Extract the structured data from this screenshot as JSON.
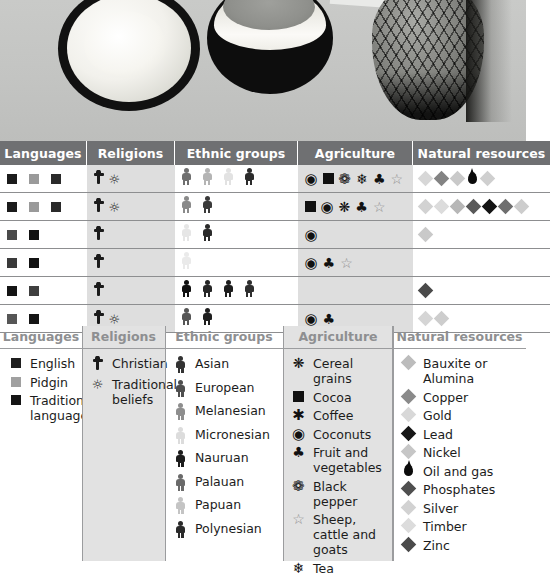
{
  "photo": {
    "alt": "black and white photo of a split coconut and a pineapple on a surface",
    "items": [
      "coconut-half-open",
      "coconut-half-bowl",
      "pineapple",
      "knife-blade"
    ]
  },
  "table": {
    "headers": [
      "Languages",
      "Religions",
      "Ethnic groups",
      "Agriculture",
      "Natural resources"
    ],
    "header_bg": "#6f7072",
    "shaded_column_bg": "#dedede",
    "rows": [
      {
        "languages": [
          {
            "type": "square",
            "color": "#1b1b1b"
          },
          {
            "type": "square",
            "color": "#9a9a9a"
          },
          {
            "type": "square",
            "color": "#2a2a2a"
          }
        ],
        "religions": [
          {
            "type": "cross",
            "color": "#1b1b1b"
          },
          {
            "type": "sun",
            "color": "#1b1b1b"
          }
        ],
        "ethnic": [
          {
            "type": "person",
            "color": "#6f6f6f"
          },
          {
            "type": "person",
            "color": "#b4b4b4"
          },
          {
            "type": "person",
            "color": "#e2e2e2"
          },
          {
            "type": "person",
            "color": "#2b2b2b"
          }
        ],
        "agriculture": [
          {
            "type": "coconut"
          },
          {
            "type": "cocoa"
          },
          {
            "type": "blackpepper"
          },
          {
            "type": "tea"
          },
          {
            "type": "fruitveg"
          },
          {
            "type": "sheep"
          }
        ],
        "resources": [
          {
            "type": "diamond",
            "color": "#d7d7d7"
          },
          {
            "type": "diamond",
            "color": "#838383"
          },
          {
            "type": "diamond",
            "color": "#c9c9c9"
          },
          {
            "type": "oil"
          },
          {
            "type": "diamond",
            "color": "#cfcfcf"
          }
        ]
      },
      {
        "languages": [
          {
            "type": "square",
            "color": "#1b1b1b"
          },
          {
            "type": "square",
            "color": "#9a9a9a"
          },
          {
            "type": "square",
            "color": "#2a2a2a"
          }
        ],
        "religions": [
          {
            "type": "cross",
            "color": "#1b1b1b"
          },
          {
            "type": "sun",
            "color": "#1b1b1b"
          }
        ],
        "ethnic": [
          {
            "type": "person",
            "color": "#8a8a8a"
          },
          {
            "type": "person",
            "color": "#3a3a3a"
          }
        ],
        "agriculture": [
          {
            "type": "cocoa"
          },
          {
            "type": "coconut"
          },
          {
            "type": "cereal"
          },
          {
            "type": "fruitveg"
          },
          {
            "type": "sheep"
          }
        ],
        "resources": [
          {
            "type": "diamond",
            "color": "#d2d2d2"
          },
          {
            "type": "diamond",
            "color": "#dcdcdc"
          },
          {
            "type": "diamond",
            "color": "#b7b7b7"
          },
          {
            "type": "diamond",
            "color": "#595959"
          },
          {
            "type": "diamond",
            "color": "#141414"
          },
          {
            "type": "diamond",
            "color": "#6e6e6e"
          },
          {
            "type": "diamond",
            "color": "#cdcdcd"
          }
        ]
      },
      {
        "languages": [
          {
            "type": "square",
            "color": "#4a4a4a"
          },
          {
            "type": "square",
            "color": "#121212"
          }
        ],
        "religions": [
          {
            "type": "cross",
            "color": "#1b1b1b"
          }
        ],
        "ethnic": [
          {
            "type": "person",
            "color": "#e6e6e6"
          },
          {
            "type": "person",
            "color": "#2b2b2b"
          }
        ],
        "agriculture": [
          {
            "type": "coconut"
          }
        ],
        "resources": [
          {
            "type": "diamond",
            "color": "#c9c9c9"
          }
        ]
      },
      {
        "languages": [
          {
            "type": "square",
            "color": "#3a3a3a"
          },
          {
            "type": "square",
            "color": "#121212"
          }
        ],
        "religions": [
          {
            "type": "cross",
            "color": "#1b1b1b"
          }
        ],
        "ethnic": [
          {
            "type": "person",
            "color": "#eaeaea"
          }
        ],
        "agriculture": [
          {
            "type": "coconut"
          },
          {
            "type": "fruitveg"
          },
          {
            "type": "sheep"
          }
        ],
        "resources": []
      },
      {
        "languages": [
          {
            "type": "square",
            "color": "#141414"
          },
          {
            "type": "square",
            "color": "#3f3f3f"
          }
        ],
        "religions": [
          {
            "type": "cross",
            "color": "#1b1b1b"
          }
        ],
        "ethnic": [
          {
            "type": "person",
            "color": "#111111"
          },
          {
            "type": "person",
            "color": "#262626"
          },
          {
            "type": "person",
            "color": "#1d1d1d"
          },
          {
            "type": "person",
            "color": "#2e2e2e"
          }
        ],
        "agriculture": [],
        "resources": [
          {
            "type": "diamond",
            "color": "#4a4a4a"
          }
        ]
      },
      {
        "languages": [
          {
            "type": "square",
            "color": "#565656"
          },
          {
            "type": "square",
            "color": "#151515"
          }
        ],
        "religions": [
          {
            "type": "cross",
            "color": "#1b1b1b"
          },
          {
            "type": "sun",
            "color": "#1b1b1b"
          }
        ],
        "ethnic": [
          {
            "type": "person",
            "color": "#565656"
          },
          {
            "type": "person",
            "color": "#1f1f1f"
          }
        ],
        "agriculture": [
          {
            "type": "coconut"
          },
          {
            "type": "fruitveg"
          }
        ],
        "resources": [
          {
            "type": "diamond",
            "color": "#d5d5d5"
          },
          {
            "type": "diamond",
            "color": "#cdcdcd"
          }
        ]
      }
    ]
  },
  "legend": {
    "columns": [
      {
        "title": "Languages",
        "shaded": false,
        "items": [
          {
            "label": "English",
            "symbol": "square",
            "color": "#1e1e1e"
          },
          {
            "label": "Pidgin",
            "symbol": "square",
            "color": "#a0a0a0"
          },
          {
            "label": "Traditional languages",
            "symbol": "square",
            "color": "#141414"
          }
        ]
      },
      {
        "title": "Religions",
        "shaded": true,
        "items": [
          {
            "label": "Christian",
            "symbol": "cross",
            "color": "#1b1b1b"
          },
          {
            "label": "Traditional beliefs",
            "symbol": "sun",
            "color": "#1b1b1b"
          }
        ]
      },
      {
        "title": "Ethnic groups",
        "shaded": false,
        "items": [
          {
            "label": "Asian",
            "symbol": "person",
            "color": "#333333"
          },
          {
            "label": "European",
            "symbol": "person",
            "color": "#4e4e4e"
          },
          {
            "label": "Melanesian",
            "symbol": "person",
            "color": "#8e8e8e"
          },
          {
            "label": "Micronesian",
            "symbol": "person",
            "color": "#dcdcdc"
          },
          {
            "label": "Nauruan",
            "symbol": "person",
            "color": "#1c1c1c"
          },
          {
            "label": "Palauan",
            "symbol": "person",
            "color": "#6a6a6a"
          },
          {
            "label": "Papuan",
            "symbol": "person",
            "color": "#c4c4c4"
          },
          {
            "label": "Polynesian",
            "symbol": "person",
            "color": "#2a2a2a"
          }
        ]
      },
      {
        "title": "Agriculture",
        "shaded": true,
        "items": [
          {
            "label": "Cereal grains",
            "symbol": "cereal",
            "color": "#111111"
          },
          {
            "label": "Cocoa",
            "symbol": "cocoa",
            "color": "#111111"
          },
          {
            "label": "Coffee",
            "symbol": "coffee",
            "color": "#111111"
          },
          {
            "label": "Coconuts",
            "symbol": "coconut",
            "color": "#111111"
          },
          {
            "label": "Fruit and vegetables",
            "symbol": "fruitveg",
            "color": "#111111"
          },
          {
            "label": "Black pepper",
            "symbol": "blackpepper",
            "color": "#111111"
          },
          {
            "label": "Sheep, cattle and goats",
            "symbol": "sheep",
            "color": "#8c8c8c"
          },
          {
            "label": "Tea",
            "symbol": "tea",
            "color": "#111111"
          }
        ]
      },
      {
        "title": "Natural resources",
        "shaded": false,
        "items": [
          {
            "label": "Bauxite or Alumina",
            "symbol": "diamond",
            "color": "#bcbcbc"
          },
          {
            "label": "Copper",
            "symbol": "diamond",
            "color": "#8a8a8a"
          },
          {
            "label": "Gold",
            "symbol": "diamond",
            "color": "#d8d8d8"
          },
          {
            "label": "Lead",
            "symbol": "diamond",
            "color": "#161616"
          },
          {
            "label": "Nickel",
            "symbol": "diamond",
            "color": "#c6c6c6"
          },
          {
            "label": "Oil and gas",
            "symbol": "oil",
            "color": "#0b0b0b"
          },
          {
            "label": "Phosphates",
            "symbol": "diamond",
            "color": "#4f4f4f"
          },
          {
            "label": "Silver",
            "symbol": "diamond",
            "color": "#d2d2d2"
          },
          {
            "label": "Timber",
            "symbol": "diamond",
            "color": "#dcdcdc"
          },
          {
            "label": "Zinc",
            "symbol": "diamond",
            "color": "#4a4a4a"
          }
        ]
      }
    ]
  }
}
